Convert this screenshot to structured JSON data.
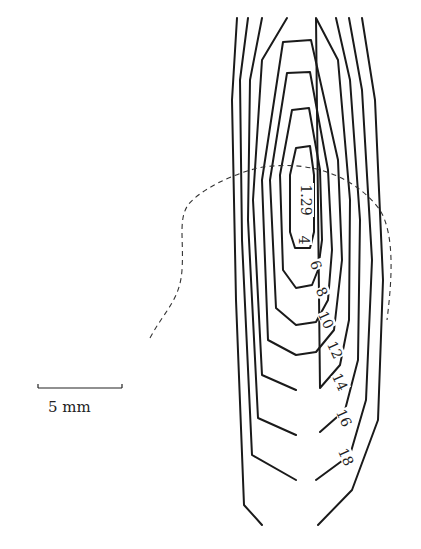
{
  "figure": {
    "type": "contour map",
    "center_value": "1.29",
    "contour_levels": [
      "4",
      "6",
      "8",
      "10",
      "12",
      "14",
      "16",
      "18"
    ],
    "scale_bar": {
      "label": "5 mm",
      "x1": 38,
      "x2": 122,
      "y": 388
    }
  },
  "colors": {
    "line": "#1a1a1a",
    "background": "#ffffff"
  },
  "labels": [
    {
      "text": "1.29",
      "x": 306,
      "y": 200,
      "rot": 90
    },
    {
      "text": "4",
      "x": 304,
      "y": 240,
      "rot": 90
    },
    {
      "text": "6",
      "x": 316,
      "y": 265,
      "rot": 70
    },
    {
      "text": "8",
      "x": 322,
      "y": 292,
      "rot": 65
    },
    {
      "text": "10",
      "x": 326,
      "y": 320,
      "rot": 65
    },
    {
      "text": "12",
      "x": 335,
      "y": 350,
      "rot": 65
    },
    {
      "text": "14",
      "x": 340,
      "y": 382,
      "rot": 65
    },
    {
      "text": "16",
      "x": 344,
      "y": 418,
      "rot": 65
    },
    {
      "text": "18",
      "x": 346,
      "y": 457,
      "rot": 65
    }
  ],
  "contours": [
    "M295,248 L290,232 L290,175 L296,148 L310,146 L314,175 L314,232 L310,248 Z",
    "M296,288 L283,270 L280,175 L292,110 L309,108 L320,170 L322,240 L318,270 L312,285 Z",
    "M296,325 L276,308 L270,180 L287,73 L310,72 L328,170 L332,250 L328,300 L316,322 Z",
    "M296,355 L268,340 L262,180 L283,42 L311,40 L338,160 L342,260 L334,330 L316,352 Z",
    "M296,390 L262,375 L253,200 L262,60 L287,18 M316,18 L338,60 L350,200 L349,320 L340,365 L320,388 Z",
    "M296,435 L258,418 L248,220 L250,80 L262,18 M336,18 L350,80 L360,220 L358,360 L345,410 L320,432",
    "M296,480 L252,455 L242,240 L240,80 L248,18 M349,18 L362,90 L372,260 L366,400 L350,455 L316,480",
    "M262,525 L244,505 L236,300 L232,100 L237,18 M362,18 L375,100 L383,280 L378,420 L352,490 L318,525"
  ],
  "outline": "M150,338 C165,310 180,300 182,270 C184,240 178,220 188,205 C200,190 230,175 258,168 C300,160 350,170 380,210 C395,235 392,280 387,320"
}
